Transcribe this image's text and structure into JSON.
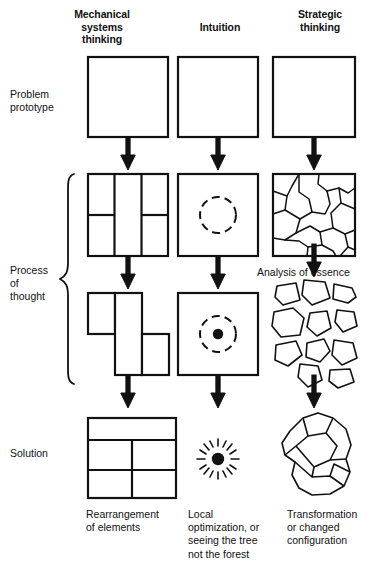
{
  "figure": {
    "background_color": "#ffffff",
    "ink_color": "#111111"
  },
  "columns": [
    {
      "id": "mechanical",
      "heading": "Mechanical\nsystems\nthinking",
      "heading_line1": "Mechanical",
      "heading_line2": "systems",
      "heading_line3": "thinking"
    },
    {
      "id": "intuition",
      "heading": "Intuition",
      "heading_line1": "Intuition",
      "heading_line2": "",
      "heading_line3": ""
    },
    {
      "id": "strategic",
      "heading": "Strategic\nthinking",
      "heading_line1": "Strategic",
      "heading_line2": "thinking",
      "heading_line3": ""
    }
  ],
  "rows": [
    {
      "id": "problem-prototype",
      "label_line1": "Problem",
      "label_line2": "prototype",
      "label_line3": ""
    },
    {
      "id": "process-of-thought",
      "label_line1": "Process",
      "label_line2": "of",
      "label_line3": "thought",
      "has_brace": true
    },
    {
      "id": "solution",
      "label_line1": "Solution",
      "label_line2": "",
      "label_line3": ""
    }
  ],
  "annotations": {
    "analysis_of_essence": "Analysis of essence"
  },
  "captions": [
    {
      "id": "mechanical-caption",
      "line1": "Rearrangement",
      "line2": "of elements",
      "line3": "",
      "line4": ""
    },
    {
      "id": "intuition-caption",
      "line1": "Local",
      "line2": "optimization, or",
      "line3": "seeing the tree",
      "line4": "not the forest"
    },
    {
      "id": "strategic-caption",
      "line1": "Transformation",
      "line2": "or changed",
      "line3": "configuration",
      "line4": ""
    }
  ],
  "cells": {
    "mechanical": {
      "row1": "empty-square",
      "row2": "square-divided-three-columns-outer-split",
      "row3": "rearranged-blocks",
      "row4": "square-strip-and-four-grid"
    },
    "intuition": {
      "row1": "empty-square",
      "row2": "square-with-dashed-circle",
      "row3": "square-with-dashed-circle-and-center-dot",
      "row4": "starburst-dot"
    },
    "strategic": {
      "row1": "empty-square",
      "row2": "square-cracked-into-fragments",
      "row3": "scattered-fragments",
      "row4": "reassembled-fragment-blob"
    }
  },
  "arrows": {
    "count": 9,
    "style": "solid-thick-down-arrow"
  }
}
